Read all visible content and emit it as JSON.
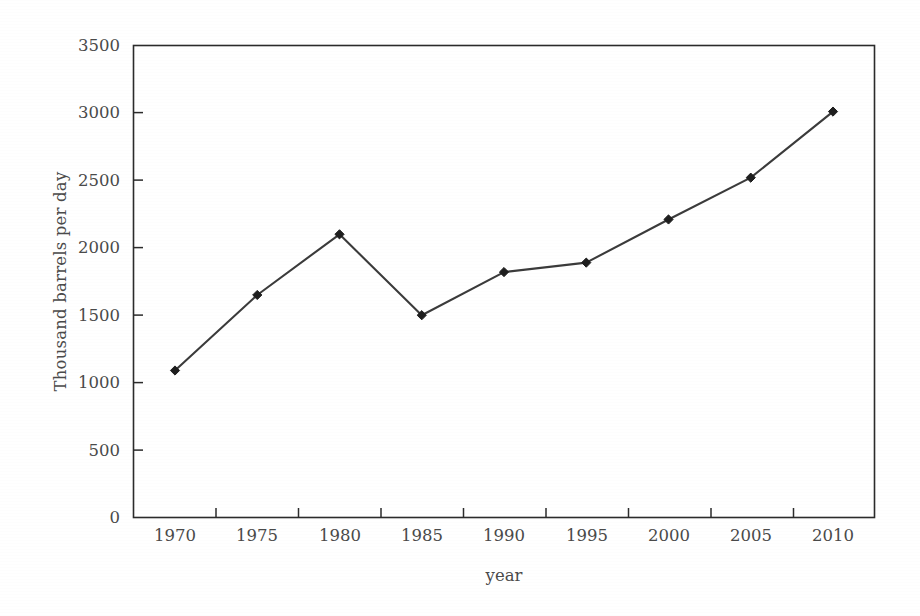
{
  "chart_data": {
    "type": "line",
    "title": "",
    "xlabel": "year",
    "ylabel": "Thousand barrels per day",
    "categories": [
      1970,
      1975,
      1980,
      1985,
      1990,
      1995,
      2000,
      2005,
      2010
    ],
    "x_tick_labels": [
      "1970",
      "1975",
      "1980",
      "1985",
      "1990",
      "1995",
      "2000",
      "2005",
      "2010"
    ],
    "values": [
      1090,
      1650,
      2100,
      1500,
      1820,
      1890,
      2210,
      2520,
      3010
    ],
    "series": [
      {
        "name": "Thousand barrels per day",
        "values": [
          1090,
          1650,
          2100,
          1500,
          1820,
          1890,
          2210,
          2520,
          3010
        ]
      }
    ],
    "ylim": [
      0,
      3500
    ],
    "y_ticks": [
      0,
      500,
      1000,
      1500,
      2000,
      2500,
      3000,
      3500
    ],
    "y_tick_labels": [
      "0",
      "500",
      "1000",
      "1500",
      "2000",
      "2500",
      "3000",
      "3500"
    ],
    "xlim": [
      1967.5,
      2012.5
    ],
    "grid": false,
    "legend": null,
    "legend_position": "none",
    "marker": "diamond",
    "line_color": "#3b3b3b",
    "marker_color": "#1e1e1e",
    "axis_color": "#2b2b2b",
    "background_color": "#ffffff"
  }
}
